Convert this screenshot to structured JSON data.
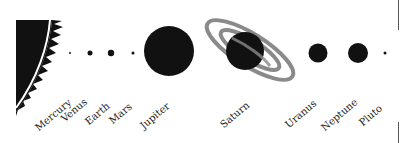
{
  "diagram": {
    "sun": {
      "name": "Sun",
      "color": "#111111"
    },
    "planets": [
      {
        "name": "Mercury",
        "cx": 70,
        "r": 1
      },
      {
        "name": "Venus",
        "cx": 90,
        "r": 2.5
      },
      {
        "name": "Earth",
        "cx": 111,
        "r": 3
      },
      {
        "name": "Mars",
        "cx": 133,
        "r": 1.5
      },
      {
        "name": "Jupiter",
        "cx": 169,
        "r": 25
      },
      {
        "name": "Saturn",
        "cx": 245,
        "r": 20
      },
      {
        "name": "Uranus",
        "cx": 318,
        "r": 9.5
      },
      {
        "name": "Neptune",
        "cx": 358,
        "r": 10
      },
      {
        "name": "Pluto",
        "cx": 385,
        "r": 1.5
      }
    ],
    "labels": [
      "Mercury",
      "Venus",
      "Earth",
      "Mars",
      "Jupiter",
      "Saturn",
      "Uranus",
      "Neptune",
      "Pluto"
    ],
    "ring_color": "#8a8a8a",
    "planet_color": "#111111"
  }
}
